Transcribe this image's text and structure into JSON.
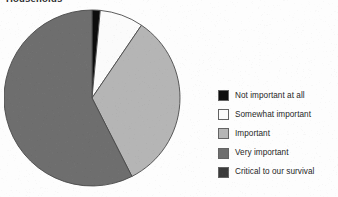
{
  "title": "Households",
  "legend": {
    "position": "right",
    "items": [
      {
        "label": "Not important at all",
        "color": "#0d0d0d"
      },
      {
        "label": "Somewhat important",
        "color": "#fbfbfb"
      },
      {
        "label": "Important",
        "color": "#b5b5b5"
      },
      {
        "label": "Very important",
        "color": "#6e6e6e"
      },
      {
        "label": "Critical to our survival",
        "color": "#3a3a3a"
      }
    ]
  },
  "chart_data": {
    "type": "pie",
    "title": "Households",
    "start_angle": 0,
    "direction": "clockwise",
    "grid": false,
    "legend_position": "right",
    "categories": [
      "Not important at all",
      "Somewhat important",
      "Important",
      "Very important",
      "Critical to our survival"
    ],
    "values": [
      1.5,
      8,
      33,
      57.5,
      0
    ],
    "colors": [
      "#0d0d0d",
      "#fbfbfb",
      "#b5b5b5",
      "#6e6e6e",
      "#3a3a3a"
    ],
    "units": "percent",
    "center": {
      "x": 92,
      "y": 98
    },
    "radius": 88,
    "slice_border_color": "#4a4a4a"
  }
}
